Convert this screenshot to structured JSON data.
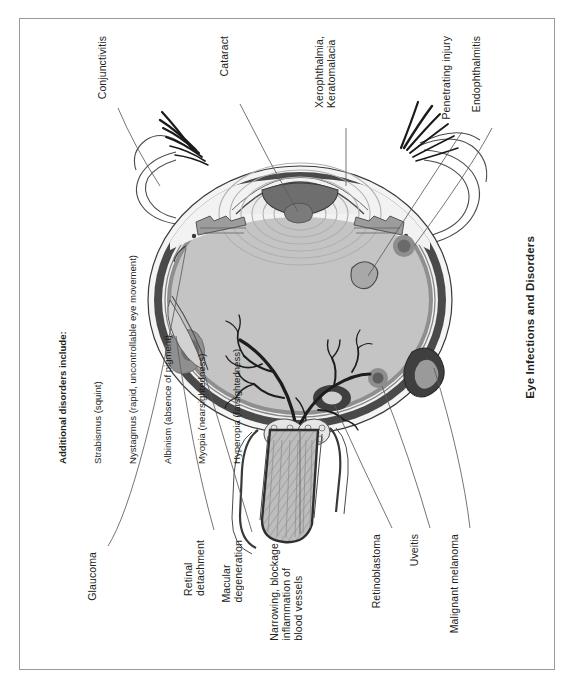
{
  "page": {
    "title": "Eye Infections and Disorders",
    "background": "#ffffff",
    "border_color": "#9a9a9a"
  },
  "labels": {
    "conjunctivitis": "Conjunctivitis",
    "cataract": "Cataract",
    "xerophthalmia": "Xerophthalmia,\nKeratomalacia",
    "endophthalmitis": "Endophthalmitis",
    "penetrating_injury": "Penetrating injury",
    "malignant_melanoma": "Malignant melanoma",
    "uveitis": "Uveitis",
    "retinoblastoma": "Retinoblastoma",
    "narrowing": "Narrowing, blockage,\ninflammation of\nblood vessels",
    "macular_degeneration": "Macular\ndegeneration",
    "retinal_detachment": "Retinal\ndetachment",
    "glaucoma": "Glaucoma"
  },
  "additional_disorders": {
    "heading": "Additional disorders include:",
    "items": [
      "Strabismus (squint)",
      "Nystagmus (rapid, uncontrollable eye movement)",
      "Albinism (absence of pigment)",
      "Myopia (nearsightedness)",
      "Hyperopia (farsightedness)"
    ]
  },
  "colors": {
    "sclera_outer": "#4a4a4a",
    "sclera_white": "#f4f4f4",
    "vitreous": "#c4c4c4",
    "choroid": "#8f8f8f",
    "lesion_dark": "#6e6e6e",
    "lesion_mid": "#9c9c9c",
    "line": "#5c5c5c",
    "ink": "#231f20"
  }
}
